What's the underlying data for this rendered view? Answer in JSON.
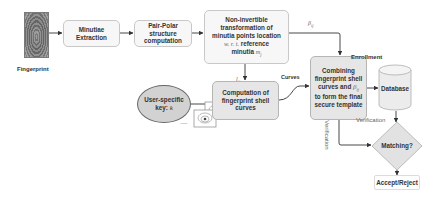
{
  "diagram": {
    "nodes": {
      "fingerprint": {
        "label": "Fingerprint"
      },
      "minutiae_extraction": {
        "label": "Minutiae Extraction"
      },
      "pair_polar": {
        "label": "Pair-Polar structure computation"
      },
      "non_invertible": {
        "line1": "Non-invertible",
        "line2": "transformation of",
        "line3": "minutia points location",
        "line4_math": "w. r. t.",
        "line4_text": " reference",
        "line5_text": "minutia ",
        "line5_math": "m",
        "line5_sub": "j"
      },
      "user_key": {
        "line1": "User-specific",
        "line2_text": "key: ",
        "line2_math": "k"
      },
      "shell_curves": {
        "label": "Computation of fingerprint shell curves"
      },
      "combining": {
        "line1": "Combining",
        "line2": "fingerprint shell",
        "line3_text": "curves and ",
        "line3_math": "β",
        "line3_sub": "ij",
        "line4": "to form the final",
        "line5": "secure template"
      },
      "enrollment": {
        "label": "Enrollment"
      },
      "database": {
        "label": "Database"
      },
      "matching": {
        "label": "Matching?"
      },
      "accept_reject": {
        "label": "Accept/Reject"
      },
      "ellipsis": {
        "label": "......"
      }
    },
    "edge_labels": {
      "beta": {
        "math": "β",
        "sub": "ij"
      },
      "l": {
        "math": "l",
        "sub": "ij"
      },
      "curves": "Curves",
      "verification_vertical": "Verification",
      "verification": "Verification"
    },
    "colors": {
      "box_fill": "#f7f7f7",
      "box_gray": "#e6e6e6",
      "border": "#c8c8c8",
      "arrow": "#333333",
      "ellipse_fill": "#d2d2d2",
      "text": "#333333"
    }
  }
}
